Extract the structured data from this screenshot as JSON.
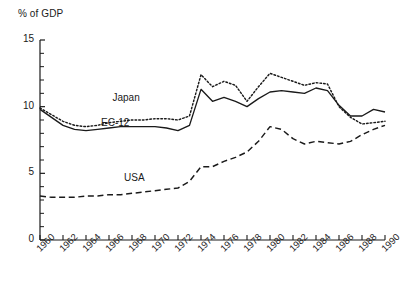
{
  "chart_data": {
    "type": "line",
    "title": "",
    "ylabel": "% of GDP",
    "xlabel": "",
    "ylim": [
      0,
      15
    ],
    "xlim": [
      1960,
      1990
    ],
    "grid": false,
    "legend_position": "inline-annotations",
    "y_ticks_major": [
      0,
      5,
      10,
      15
    ],
    "y_ticks_minor_step": 1,
    "x_ticks": [
      1960,
      1962,
      1964,
      1966,
      1968,
      1970,
      1972,
      1974,
      1976,
      1978,
      1980,
      1982,
      1984,
      1986,
      1988,
      1990
    ],
    "x": [
      1960,
      1961,
      1962,
      1963,
      1964,
      1965,
      1966,
      1967,
      1968,
      1969,
      1970,
      1971,
      1972,
      1973,
      1974,
      1975,
      1976,
      1977,
      1978,
      1979,
      1980,
      1981,
      1982,
      1983,
      1984,
      1985,
      1986,
      1987,
      1988,
      1989,
      1990
    ],
    "series": [
      {
        "name": "Japan",
        "style": "dotted",
        "color": "#1a1a1a",
        "label_x": 1967,
        "label_y": 10.6,
        "values": [
          9.9,
          9.4,
          8.9,
          8.6,
          8.5,
          8.6,
          8.8,
          8.9,
          9.0,
          9.0,
          9.1,
          9.1,
          9.0,
          9.3,
          12.4,
          11.5,
          11.9,
          11.6,
          10.4,
          11.5,
          12.5,
          12.2,
          11.9,
          11.6,
          11.8,
          11.7,
          10.0,
          9.2,
          8.7,
          8.8,
          8.9
        ]
      },
      {
        "name": "EC-12",
        "style": "solid",
        "color": "#1a1a1a",
        "label_x": 1966,
        "label_y": 8.7,
        "values": [
          9.8,
          9.2,
          8.6,
          8.3,
          8.2,
          8.3,
          8.4,
          8.5,
          8.5,
          8.5,
          8.5,
          8.4,
          8.2,
          8.6,
          11.3,
          10.4,
          10.7,
          10.4,
          10.0,
          10.6,
          11.1,
          11.2,
          11.1,
          11.0,
          11.4,
          11.2,
          10.1,
          9.3,
          9.3,
          9.8,
          9.6
        ]
      },
      {
        "name": "USA",
        "style": "dashed",
        "color": "#1a1a1a",
        "label_x": 1968,
        "label_y": 4.6,
        "values": [
          3.3,
          3.2,
          3.2,
          3.2,
          3.3,
          3.3,
          3.4,
          3.4,
          3.5,
          3.6,
          3.7,
          3.8,
          3.9,
          4.4,
          5.5,
          5.5,
          5.9,
          6.2,
          6.6,
          7.4,
          8.5,
          8.3,
          7.6,
          7.2,
          7.4,
          7.3,
          7.2,
          7.4,
          7.9,
          8.3,
          8.6
        ]
      }
    ]
  }
}
